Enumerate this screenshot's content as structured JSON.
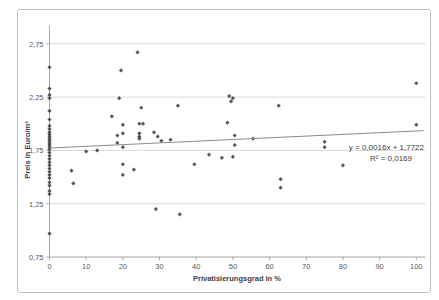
{
  "chart_data": {
    "type": "scatter",
    "title": "",
    "xlabel": "Privatisierungsgrad in %",
    "ylabel": "Preis in Euro/m³",
    "xlim": [
      0,
      102.5
    ],
    "ylim": [
      0.75,
      2.92
    ],
    "grid": "horizontal-only",
    "legend": "none",
    "x_ticks": [
      0,
      10,
      20,
      30,
      40,
      50,
      60,
      70,
      80,
      90,
      100
    ],
    "y_ticks": [
      0.75,
      1.25,
      1.75,
      2.25,
      2.75
    ],
    "y_tick_labels": [
      "0,75",
      "1,25",
      "1,75",
      "2,25",
      "2,75"
    ],
    "x_tick_labels": [
      "0",
      "10",
      "20",
      "30",
      "40",
      "50",
      "60",
      "70",
      "80",
      "90",
      "100"
    ],
    "points": [
      [
        0,
        2.53
      ],
      [
        0,
        2.33
      ],
      [
        0,
        2.27
      ],
      [
        0,
        2.24
      ],
      [
        0,
        2.12
      ],
      [
        0,
        2.04
      ],
      [
        0,
        1.98
      ],
      [
        0,
        1.95
      ],
      [
        0,
        1.92
      ],
      [
        0,
        1.9
      ],
      [
        0,
        1.88
      ],
      [
        0,
        1.86
      ],
      [
        0,
        1.84
      ],
      [
        0,
        1.82
      ],
      [
        0,
        1.8
      ],
      [
        0,
        1.78
      ],
      [
        0,
        1.76
      ],
      [
        0,
        1.73
      ],
      [
        0,
        1.7
      ],
      [
        0,
        1.67
      ],
      [
        0,
        1.64
      ],
      [
        0,
        1.61
      ],
      [
        0,
        1.58
      ],
      [
        0,
        1.55
      ],
      [
        0,
        1.52
      ],
      [
        0,
        1.49
      ],
      [
        0,
        1.45
      ],
      [
        0,
        1.42
      ],
      [
        0,
        1.37
      ],
      [
        0,
        1.34
      ],
      [
        0,
        0.97
      ],
      [
        6,
        1.56
      ],
      [
        6.5,
        1.44
      ],
      [
        10,
        1.74
      ],
      [
        13,
        1.75
      ],
      [
        17,
        2.07
      ],
      [
        18.5,
        1.89
      ],
      [
        18.5,
        1.82
      ],
      [
        19,
        2.24
      ],
      [
        19.5,
        2.5
      ],
      [
        20,
        1.99
      ],
      [
        20,
        1.91
      ],
      [
        20,
        1.78
      ],
      [
        20,
        1.62
      ],
      [
        20,
        1.52
      ],
      [
        23,
        1.57
      ],
      [
        24,
        2.67
      ],
      [
        24.5,
        2.0
      ],
      [
        24.5,
        1.91
      ],
      [
        24.5,
        1.88
      ],
      [
        24.5,
        1.86
      ],
      [
        25,
        2.15
      ],
      [
        25.5,
        2.0
      ],
      [
        28.5,
        1.92
      ],
      [
        29,
        1.2
      ],
      [
        29.5,
        1.88
      ],
      [
        30.5,
        1.84
      ],
      [
        33,
        1.85
      ],
      [
        35,
        2.17
      ],
      [
        35.5,
        1.15
      ],
      [
        39.5,
        1.62
      ],
      [
        43.5,
        1.71
      ],
      [
        47,
        1.68
      ],
      [
        48.5,
        2.01
      ],
      [
        49,
        2.26
      ],
      [
        49.5,
        2.21
      ],
      [
        50,
        2.24
      ],
      [
        50,
        1.69
      ],
      [
        50.5,
        1.8
      ],
      [
        50.5,
        1.89
      ],
      [
        55.5,
        1.86
      ],
      [
        62.5,
        2.17
      ],
      [
        63,
        1.48
      ],
      [
        63,
        1.4
      ],
      [
        75,
        1.83
      ],
      [
        75,
        1.78
      ],
      [
        80,
        1.61
      ],
      [
        100,
        2.38
      ],
      [
        100,
        1.99
      ]
    ],
    "trendline": {
      "slope": 0.0016,
      "intercept": 1.7722,
      "x_start": 0,
      "x_end": 102,
      "equation_label": "y = 0,0016x + 1,7722",
      "r_squared_label": "R² = 0,0169"
    },
    "colors": {
      "point": "#3f3f3f",
      "trendline": "#8c8c8c",
      "gridline": "#d9d9d9",
      "axis": "#a6a6a6",
      "tick_text": "#595959",
      "frame_border": "#bfbfbf",
      "background": "#ffffff"
    }
  }
}
